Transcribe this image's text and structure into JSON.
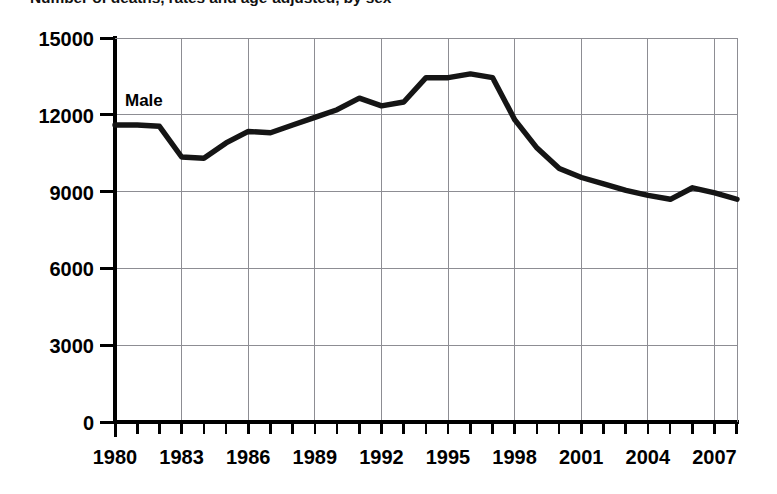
{
  "chart_data": {
    "type": "line",
    "title": "Number of deaths, rates and age-adjusted, by sex",
    "series_label": "Male",
    "xlabel": "",
    "ylabel": "",
    "grid": true,
    "legend_position": "inline-top-left",
    "xlim": [
      1980,
      2008
    ],
    "ylim": [
      0,
      15000
    ],
    "ytick_labels": [
      "15000",
      "12000",
      "9000",
      "6000",
      "3000",
      "0"
    ],
    "ytick_values": [
      15000,
      12000,
      9000,
      6000,
      3000,
      0
    ],
    "xtick_labels": [
      "1980",
      "1983",
      "1986",
      "1989",
      "1992",
      "1995",
      "1998",
      "2001",
      "2004",
      "2007"
    ],
    "xtick_values": [
      1980,
      1983,
      1986,
      1989,
      1992,
      1995,
      1998,
      2001,
      2004,
      2007
    ],
    "x": [
      1980,
      1981,
      1982,
      1983,
      1984,
      1985,
      1986,
      1987,
      1988,
      1989,
      1990,
      1991,
      1992,
      1993,
      1994,
      1995,
      1996,
      1997,
      1998,
      1999,
      2000,
      2001,
      2002,
      2003,
      2004,
      2005,
      2006,
      2007,
      2008
    ],
    "series": [
      {
        "name": "Male",
        "color": "#151515",
        "values": [
          11600,
          11600,
          11550,
          10350,
          10300,
          10900,
          11350,
          11300,
          11600,
          11900,
          12200,
          12650,
          12350,
          12500,
          13450,
          13450,
          13600,
          13450,
          11800,
          10700,
          9900,
          9550,
          9300,
          9050,
          8850,
          8700,
          9150,
          8950,
          8700
        ]
      }
    ],
    "colors": {
      "line": "#151515",
      "grid": "#8d8d93",
      "axis": "#000000",
      "background": "#ffffff"
    }
  }
}
